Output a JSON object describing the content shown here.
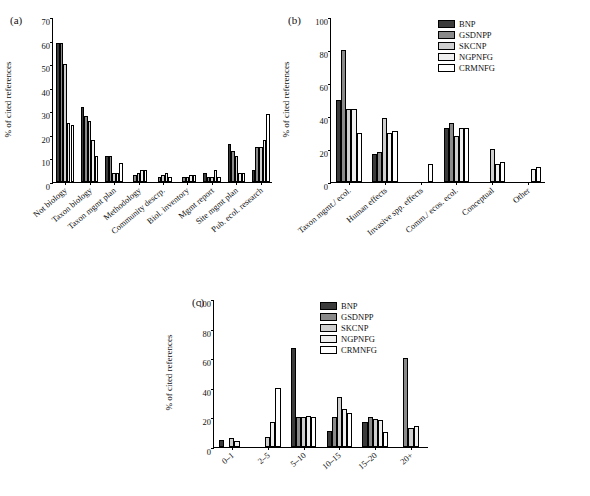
{
  "figure": {
    "series_colors": [
      "#3b3b3b",
      "#8a8a8a",
      "#cfcfcf",
      "#efefef",
      "#ffffff"
    ],
    "series_names": [
      "BNP",
      "GSDNPP",
      "SKCNP",
      "NGPNFG",
      "CRMNFG"
    ]
  },
  "panels": [
    {
      "label": "(a)",
      "ylabel": "% of cited references",
      "yticks": [
        "0",
        "10",
        "20",
        "30",
        "40",
        "50",
        "60",
        "70"
      ],
      "show_legend": false,
      "chart_data": {
        "type": "bar",
        "title": "(a)",
        "xlabel": "",
        "ylabel": "% of cited references",
        "ylim": [
          0,
          70
        ],
        "grid": false,
        "legend_position": "none",
        "categories": [
          "Not biology",
          "Taxon biology",
          "Taxon mgmt plan",
          "Methodology",
          "Community descrp.",
          "Biol. inventory",
          "Mgmt report",
          "Site mgmt plan",
          "Pub. ecol. research"
        ],
        "series": [
          {
            "name": "BNP",
            "values": [
              59,
              32,
              11,
              0,
              0,
              0,
              4,
              16,
              5
            ]
          },
          {
            "name": "GSDNPP",
            "values": [
              59,
              28,
              11,
              3,
              2,
              2,
              2,
              13,
              15
            ]
          },
          {
            "name": "SKCNP",
            "values": [
              50,
              26,
              4,
              4,
              3,
              2,
              2,
              11,
              15
            ]
          },
          {
            "name": "NGPNFG",
            "values": [
              25,
              18,
              4,
              5,
              4,
              3,
              5,
              4,
              18
            ]
          },
          {
            "name": "CRMNFG",
            "values": [
              24,
              11,
              8,
              5,
              2,
              3,
              2,
              4,
              29
            ]
          }
        ]
      }
    },
    {
      "label": "(b)",
      "ylabel": "% of cited references",
      "yticks": [
        "0",
        "20",
        "40",
        "60",
        "80",
        "100"
      ],
      "show_legend": true,
      "chart_data": {
        "type": "bar",
        "title": "(b)",
        "xlabel": "",
        "ylabel": "% of cited references",
        "ylim": [
          0,
          100
        ],
        "grid": false,
        "legend_position": "top-right",
        "categories": [
          "Taxon mgmt./ ecol.",
          "Human effects",
          "Invasive spp. effects",
          "Comm./ ecos. ecol.",
          "Conceptual",
          "Other"
        ],
        "series": [
          {
            "name": "BNP",
            "values": [
              50,
              17,
              0,
              33,
              0,
              0
            ]
          },
          {
            "name": "GSDNPP",
            "values": [
              80,
              18,
              0,
              36,
              0,
              0
            ]
          },
          {
            "name": "SKCNP",
            "values": [
              44,
              39,
              0,
              28,
              20,
              0
            ]
          },
          {
            "name": "NGPNFG",
            "values": [
              44,
              30,
              0,
              33,
              11,
              8
            ]
          },
          {
            "name": "CRMNFG",
            "values": [
              30,
              31,
              11,
              33,
              12,
              9
            ]
          }
        ]
      }
    },
    {
      "label": "(c)",
      "ylabel": "% of cited references",
      "yticks": [
        "0",
        "20",
        "40",
        "60",
        "80",
        "100"
      ],
      "show_legend": true,
      "chart_data": {
        "type": "bar",
        "title": "(c)",
        "xlabel": "",
        "ylabel": "% of cited references",
        "ylim": [
          0,
          100
        ],
        "grid": false,
        "legend_position": "top-right",
        "categories": [
          "0–1",
          "2–5",
          "5–10",
          "10–15",
          "15–20",
          "20+"
        ],
        "series": [
          {
            "name": "BNP",
            "values": [
              5,
              0,
              67,
              11,
              17,
              0
            ]
          },
          {
            "name": "GSDNPP",
            "values": [
              0,
              0,
              20,
              20,
              20,
              60
            ]
          },
          {
            "name": "SKCNP",
            "values": [
              6,
              7,
              20,
              34,
              19,
              13
            ]
          },
          {
            "name": "NGPNFG",
            "values": [
              4,
              17,
              21,
              26,
              18,
              14
            ]
          },
          {
            "name": "CRMNFG",
            "values": [
              0,
              40,
              20,
              23,
              10,
              0
            ]
          }
        ]
      }
    }
  ]
}
